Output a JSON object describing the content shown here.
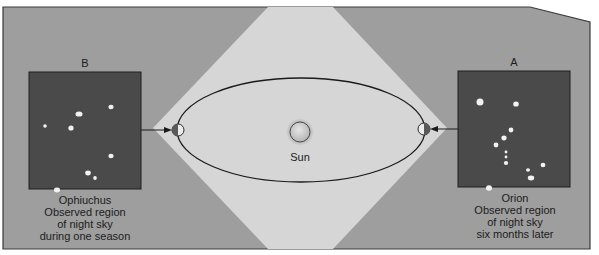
{
  "diagram": {
    "colors": {
      "background": "#ffffff",
      "panel": "#9e9e9e",
      "panel_border": "#3a3a3a",
      "sunlight_region": "#d6d6d6",
      "night_sky": "#4a4a4a",
      "star": "#f2f2f2",
      "orbit": "#1a1a1a",
      "sun_fill": "#c8c8c8",
      "text": "#1c1c1c"
    },
    "sun": {
      "label": "Sun"
    },
    "left_panel": {
      "letter": "B",
      "caption": [
        "Ophiuchus",
        "Observed region",
        "of night sky",
        "during one season"
      ]
    },
    "right_panel": {
      "letter": "A",
      "caption": [
        "Orion",
        "Observed region",
        "of night sky",
        "six months later"
      ]
    },
    "stars_B": [
      {
        "x": 50,
        "y": 42,
        "rx": 3.5,
        "ry": 2.6
      },
      {
        "x": 82,
        "y": 35,
        "rx": 2.6,
        "ry": 2.2
      },
      {
        "x": 42,
        "y": 56,
        "rx": 2.6,
        "ry": 2.6
      },
      {
        "x": 16,
        "y": 54,
        "rx": 1.8,
        "ry": 1.8
      },
      {
        "x": 82,
        "y": 84,
        "rx": 2.6,
        "ry": 2.2
      },
      {
        "x": 59,
        "y": 101,
        "rx": 2.8,
        "ry": 2.4
      },
      {
        "x": 66,
        "y": 106,
        "rx": 1.8,
        "ry": 2.0
      },
      {
        "x": 28,
        "y": 118,
        "rx": 3.0,
        "ry": 2.4
      }
    ],
    "stars_A": [
      {
        "x": 22,
        "y": 31,
        "rx": 3.5,
        "ry": 3.5
      },
      {
        "x": 58,
        "y": 33,
        "rx": 2.8,
        "ry": 2.6
      },
      {
        "x": 53,
        "y": 59,
        "rx": 2.4,
        "ry": 2.4
      },
      {
        "x": 46,
        "y": 67,
        "rx": 2.6,
        "ry": 2.4
      },
      {
        "x": 38,
        "y": 74,
        "rx": 2.4,
        "ry": 2.4
      },
      {
        "x": 48,
        "y": 81,
        "rx": 1.4,
        "ry": 1.4
      },
      {
        "x": 48,
        "y": 86,
        "rx": 1.4,
        "ry": 1.4
      },
      {
        "x": 48,
        "y": 92,
        "rx": 2.2,
        "ry": 2.0
      },
      {
        "x": 85,
        "y": 94,
        "rx": 2.4,
        "ry": 2.2
      },
      {
        "x": 70,
        "y": 99,
        "rx": 2.0,
        "ry": 1.8
      },
      {
        "x": 73,
        "y": 107,
        "rx": 3.2,
        "ry": 2.4
      },
      {
        "x": 31,
        "y": 117,
        "rx": 3.0,
        "ry": 2.8
      }
    ]
  }
}
